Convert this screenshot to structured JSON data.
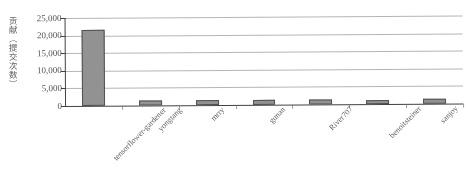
{
  "chart_data": {
    "type": "bar",
    "title": "",
    "xlabel": "",
    "ylabel": "贡献（提交次数）",
    "categories": [
      "tensorflower-gardener",
      "yongtang",
      "mrry",
      "gunan",
      "River707",
      "benoitsteiner",
      "sanjoy"
    ],
    "values": [
      21500,
      1400,
      1300,
      1350,
      1300,
      1250,
      1300
    ],
    "ylim": [
      0,
      25000
    ],
    "ytick_labels": [
      "25,000",
      "20,000",
      "15,000",
      "10,000",
      "5,000",
      "0"
    ],
    "ytick_values": [
      25000,
      20000,
      15000,
      10000,
      5000,
      0
    ],
    "grid": true,
    "legend": false,
    "bar_color": "#8f8f8f",
    "bar_edge_color": "#4a4a4a",
    "axis_color": "#3a3a3a",
    "grid_color": "#9a9a9a"
  },
  "caption": ""
}
